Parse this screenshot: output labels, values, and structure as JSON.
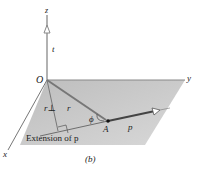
{
  "figure": {
    "caption": "(b)",
    "axes": {
      "x": "x",
      "y": "y",
      "z": "z"
    },
    "origin_label": "O",
    "point_label": "A",
    "angle_label": "ϕ",
    "vectors": {
      "unit_z": "t",
      "r": "r",
      "r_perp": "r⊥",
      "p": "p"
    },
    "annotation": "Extension of p",
    "colors": {
      "plane": "#c8c8c8",
      "axis": "#888888",
      "vector": "#555555"
    }
  }
}
